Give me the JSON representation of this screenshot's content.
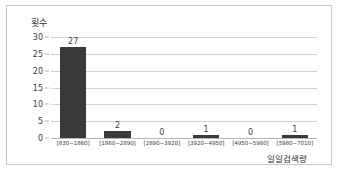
{
  "chart_data": {
    "type": "bar",
    "title": "",
    "xlabel": "일일검색량",
    "ylabel": "횟수",
    "categories": [
      "[830~1860]",
      "[1860~2890]",
      "[2890~3920]",
      "[3920~4950]",
      "[4950~5980]",
      "[5980~7010]"
    ],
    "values": [
      27,
      2,
      0,
      1,
      0,
      1
    ],
    "data_labels": [
      "27",
      "2",
      "0",
      "1",
      "0",
      "1"
    ],
    "ylim": [
      0,
      30
    ],
    "yticks": [
      0,
      5,
      10,
      15,
      20,
      25,
      30
    ],
    "ytick_labels": [
      "0",
      "5",
      "10",
      "15",
      "20",
      "25",
      "30"
    ],
    "grid": "horizontal",
    "legend": "none",
    "bar_color": "#3a3a3a",
    "gridline_color": "#d0d0d0",
    "frame_color": "#c8c8c8"
  }
}
